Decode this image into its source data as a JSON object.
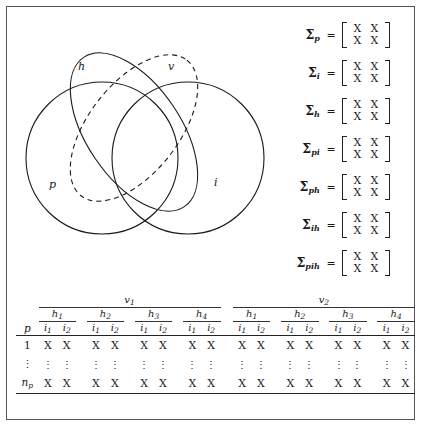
{
  "figure": {
    "title": "",
    "border_color": "#555555",
    "background": "#ffffff"
  },
  "venn": {
    "caption": "",
    "sets": [
      {
        "id": "p",
        "label": "p",
        "shape": "circle",
        "style": "solid",
        "label_x": 33,
        "label_y": 143
      },
      {
        "id": "i",
        "label": "i",
        "shape": "circle",
        "style": "solid",
        "label_x": 198,
        "label_y": 141
      },
      {
        "id": "h",
        "label": "h",
        "shape": "ellipse",
        "style": "solid",
        "label_x": 62,
        "label_y": 25
      },
      {
        "id": "v",
        "label": "v",
        "shape": "ellipse",
        "style": "dashed",
        "label_x": 152,
        "label_y": 25
      }
    ]
  },
  "sigma_equations": [
    {
      "symbol": "Σ",
      "subscript": "p",
      "equals": "=",
      "matrix": [
        [
          "X",
          "X"
        ],
        [
          "X",
          "X"
        ]
      ]
    },
    {
      "symbol": "Σ",
      "subscript": "i",
      "equals": "=",
      "matrix": [
        [
          "X",
          "X"
        ],
        [
          "X",
          "X"
        ]
      ]
    },
    {
      "symbol": "Σ",
      "subscript": "h",
      "equals": "=",
      "matrix": [
        [
          "X",
          "X"
        ],
        [
          "X",
          "X"
        ]
      ]
    },
    {
      "symbol": "Σ",
      "subscript": "pi",
      "equals": "=",
      "matrix": [
        [
          "X",
          "X"
        ],
        [
          "X",
          "X"
        ]
      ]
    },
    {
      "symbol": "Σ",
      "subscript": "ph",
      "equals": "=",
      "matrix": [
        [
          "X",
          "X"
        ],
        [
          "X",
          "X"
        ]
      ]
    },
    {
      "symbol": "Σ",
      "subscript": "ih",
      "equals": "=",
      "matrix": [
        [
          "X",
          "X"
        ],
        [
          "X",
          "X"
        ]
      ]
    },
    {
      "symbol": "Σ",
      "subscript": "pih",
      "equals": "=",
      "matrix": [
        [
          "X",
          "X"
        ],
        [
          "X",
          "X"
        ]
      ]
    }
  ],
  "table": {
    "row_header_label": "p",
    "v_groups": [
      {
        "base": "v",
        "sub": "1"
      },
      {
        "base": "v",
        "sub": "2"
      }
    ],
    "h_groups": [
      {
        "base": "h",
        "sub": "1"
      },
      {
        "base": "h",
        "sub": "2"
      },
      {
        "base": "h",
        "sub": "3"
      },
      {
        "base": "h",
        "sub": "4"
      }
    ],
    "i_columns": [
      {
        "base": "i",
        "sub": "1"
      },
      {
        "base": "i",
        "sub": "2"
      }
    ],
    "rows": [
      {
        "label": "1",
        "label_sub": "",
        "label_italic": false,
        "cells": [
          "X",
          "X",
          "X",
          "X",
          "X",
          "X",
          "X",
          "X",
          "X",
          "X",
          "X",
          "X",
          "X",
          "X",
          "X",
          "X"
        ]
      },
      {
        "label": "⋮",
        "label_sub": "",
        "label_italic": false,
        "cells": [
          "⋮",
          "⋮",
          "⋮",
          "⋮",
          "⋮",
          "⋮",
          "⋮",
          "⋮",
          "⋮",
          "⋮",
          "⋮",
          "⋮",
          "⋮",
          "⋮",
          "⋮",
          "⋮"
        ]
      },
      {
        "label": "n",
        "label_sub": "p",
        "label_italic": true,
        "cells": [
          "X",
          "X",
          "X",
          "X",
          "X",
          "X",
          "X",
          "X",
          "X",
          "X",
          "X",
          "X",
          "X",
          "X",
          "X",
          "X"
        ]
      }
    ]
  }
}
